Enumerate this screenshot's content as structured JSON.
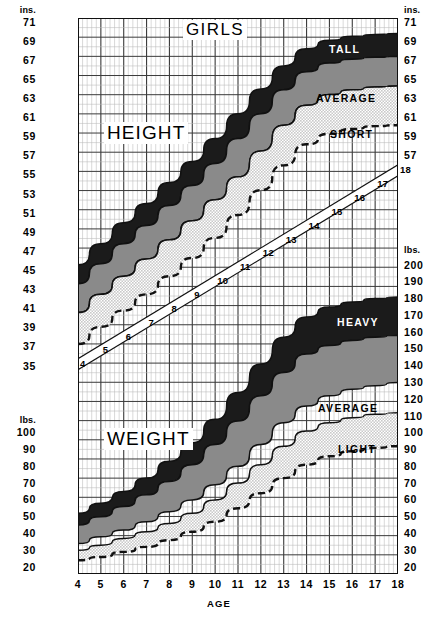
{
  "title": "GIRLS",
  "section_labels": {
    "height": "HEIGHT",
    "weight": "WEIGHT"
  },
  "axis": {
    "x_title": "AGE",
    "x_ticks": [
      "4",
      "5",
      "6",
      "7",
      "8",
      "9",
      "10",
      "11",
      "12",
      "13",
      "14",
      "15",
      "16",
      "17",
      "18"
    ],
    "left_height_unit": "ins.",
    "left_height_ticks": [
      "71",
      "69",
      "67",
      "65",
      "63",
      "61",
      "59",
      "57",
      "55",
      "53",
      "51",
      "49",
      "47",
      "45",
      "43",
      "41",
      "39",
      "37",
      "35"
    ],
    "left_weight_unit": "lbs.",
    "left_weight_ticks": [
      "100",
      "90",
      "80",
      "70",
      "60",
      "50",
      "40",
      "30",
      "20"
    ],
    "right_height_unit": "ins.",
    "right_height_ticks": [
      "71",
      "69",
      "67",
      "65",
      "63",
      "61",
      "59",
      "57"
    ],
    "right_weight_unit": "lbs.",
    "right_weight_ticks": [
      "200",
      "190",
      "180",
      "170",
      "160",
      "150",
      "140",
      "130",
      "120",
      "110",
      "100",
      "90",
      "80",
      "70",
      "60",
      "50",
      "40",
      "30",
      "20"
    ]
  },
  "band_labels": {
    "height_tall": "TALL",
    "height_average": "AVERAGE",
    "height_short": "SHORT",
    "weight_heavy": "HEAVY",
    "weight_average": "AVERAGE",
    "weight_light": "LIGHT"
  },
  "diagonal_age_labels": [
    "4",
    "5",
    "6",
    "7",
    "8",
    "9",
    "10",
    "11",
    "12",
    "13",
    "14",
    "15",
    "16",
    "17",
    "18"
  ],
  "colors": {
    "band_dark": "#1b1b1b",
    "band_mid": "#8a8a8a",
    "band_light": "#c9c9c9",
    "grid_minor": "#b9b9b9",
    "grid_major": "#3a3a3a",
    "frame": "#111111",
    "paper": "#ffffff"
  },
  "chart_data": {
    "type": "line",
    "title": "GIRLS",
    "xlabel": "AGE",
    "ylabel": "HEIGHT (ins.) / WEIGHT (lbs.)",
    "x": [
      4,
      5,
      6,
      7,
      8,
      9,
      10,
      11,
      12,
      13,
      14,
      15,
      16,
      17,
      18
    ],
    "grid": true,
    "legend_position": "inline-band-labels",
    "panels": [
      {
        "name": "HEIGHT",
        "unit": "ins.",
        "ylim": [
          34,
          72
        ],
        "left_ticks": [
          71,
          69,
          67,
          65,
          63,
          61,
          59,
          57,
          55,
          53,
          51,
          49,
          47,
          45,
          43,
          41,
          39,
          37,
          35
        ],
        "right_ticks": [
          71,
          69,
          67,
          65,
          63,
          61,
          59,
          57
        ],
        "series": [
          {
            "name": "TALL",
            "band": "upper",
            "style": "solid",
            "fill": "#1b1b1b",
            "values": [
              45.6,
              47.8,
              50.0,
              52.0,
              54.2,
              56.4,
              58.8,
              61.4,
              64.0,
              66.4,
              68.2,
              69.1,
              69.5,
              69.7,
              69.8
            ]
          },
          {
            "name": "TALL",
            "band": "lower",
            "style": "solid",
            "fill": "#1b1b1b",
            "values": [
              43.6,
              45.7,
              47.8,
              49.7,
              51.8,
              53.9,
              56.2,
              58.8,
              61.4,
              63.9,
              65.8,
              66.7,
              67.1,
              67.3,
              67.4
            ]
          },
          {
            "name": "AVERAGE",
            "band": "upper",
            "style": "solid",
            "fill": "#8a8a8a",
            "values": [
              43.6,
              45.7,
              47.8,
              49.7,
              51.8,
              53.9,
              56.2,
              58.8,
              61.4,
              63.9,
              65.8,
              66.7,
              67.1,
              67.3,
              67.4
            ]
          },
          {
            "name": "AVERAGE",
            "band": "lower",
            "style": "solid",
            "fill": "#8a8a8a",
            "values": [
              40.6,
              42.5,
              44.4,
              46.2,
              48.2,
              50.2,
              52.4,
              54.8,
              57.5,
              60.2,
              62.3,
              63.4,
              63.9,
              64.2,
              64.3
            ]
          },
          {
            "name": "SHORT",
            "band": "upper",
            "style": "solid",
            "fill": "#c9c9c9",
            "values": [
              40.6,
              42.5,
              44.4,
              46.2,
              48.2,
              50.2,
              52.4,
              54.8,
              57.5,
              60.2,
              62.3,
              63.4,
              63.9,
              64.2,
              64.3
            ]
          },
          {
            "name": "SHORT",
            "band": "lower",
            "style": "dashed",
            "fill": "#c9c9c9",
            "values": [
              37.3,
              39.1,
              40.8,
              42.5,
              44.4,
              46.3,
              48.4,
              50.8,
              53.4,
              56.0,
              58.2,
              59.3,
              59.8,
              60.1,
              60.2
            ]
          }
        ]
      },
      {
        "name": "WEIGHT",
        "unit": "lbs.",
        "ylim": [
          18,
          205
        ],
        "left_ticks": [
          100,
          90,
          80,
          70,
          60,
          50,
          40,
          30,
          20
        ],
        "right_ticks": [
          200,
          190,
          180,
          170,
          160,
          150,
          140,
          130,
          120,
          110,
          100,
          90,
          80,
          70,
          60,
          50,
          40,
          30,
          20
        ],
        "series": [
          {
            "name": "HEAVY",
            "band": "upper",
            "style": "solid",
            "fill": "#1b1b1b",
            "values": [
              52,
              58,
              65,
              73,
              83,
              94,
              108,
              124,
              141,
              157,
              169,
              175,
              178,
              180,
              181
            ]
          },
          {
            "name": "HEAVY",
            "band": "lower",
            "style": "solid",
            "fill": "#1b1b1b",
            "values": [
              45,
              50,
              56,
              63,
              71,
              81,
              93,
              107,
              122,
              136,
              147,
              152,
              155,
              157,
              158
            ]
          },
          {
            "name": "AVERAGE",
            "band": "upper",
            "style": "solid",
            "fill": "#8a8a8a",
            "values": [
              45,
              50,
              56,
              63,
              71,
              81,
              93,
              107,
              122,
              136,
              147,
              152,
              155,
              157,
              158
            ]
          },
          {
            "name": "AVERAGE",
            "band": "lower",
            "style": "solid",
            "fill": "#8a8a8a",
            "values": [
              34,
              38,
              42,
              47,
              53,
              60,
              69,
              80,
              93,
              106,
              116,
              122,
              126,
              128,
              130
            ]
          },
          {
            "name": "LIGHT",
            "band": "upper",
            "style": "solid",
            "fill": "#c9c9c9",
            "values": [
              30,
              33,
              37,
              41,
              46,
              52,
              60,
              70,
              81,
              92,
              101,
              106,
              109,
              111,
              112
            ]
          },
          {
            "name": "LIGHT",
            "band": "lower",
            "style": "dashed",
            "fill": "#c9c9c9",
            "values": [
              24,
              26,
              29,
              32,
              36,
              41,
              47,
              55,
              64,
              73,
              81,
              86,
              89,
              91,
              92
            ]
          }
        ]
      },
      {
        "name": "AGE-DIAGONAL",
        "description": "white diagonal guide band crossing the middle of the chart, labelled with ages 4 through 18",
        "labels": [
          4,
          5,
          6,
          7,
          8,
          9,
          10,
          11,
          12,
          13,
          14,
          15,
          16,
          17,
          18
        ]
      }
    ]
  }
}
